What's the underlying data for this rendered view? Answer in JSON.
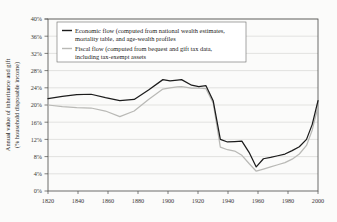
{
  "chart_data": {
    "type": "line",
    "title": "",
    "xlabel": "",
    "ylabel": "Annual value of inheritance and gift (% household disposable income)",
    "ylabel_line1": "Annual value of inheritance and gift",
    "ylabel_line2": "(% household disposable income)",
    "xlim": [
      1820,
      2008
    ],
    "ylim": [
      0,
      40
    ],
    "grid": true,
    "legend_position": "upper-left",
    "xticks": [
      1820,
      1840,
      1860,
      1880,
      1900,
      1920,
      1940,
      1960,
      1980,
      2000
    ],
    "xtick_labels": [
      "1820",
      "1840",
      "1860",
      "1880",
      "1900",
      "1920",
      "1940",
      "1960",
      "1980",
      "2000"
    ],
    "yticks": [
      0,
      4,
      8,
      12,
      16,
      20,
      24,
      28,
      32,
      36,
      40
    ],
    "ytick_labels": [
      "0%",
      "4%",
      "8%",
      "12%",
      "16%",
      "20%",
      "24%",
      "28%",
      "32%",
      "36%",
      "40%"
    ],
    "series": [
      {
        "name": "Economic flow (computed from national wealth estimates, mortality table, and age-wealth profiles",
        "legend_label_line1": "Economic flow (computed from national wealth estimates,",
        "legend_label_line2": "mortality table, and age-wealth profiles",
        "color": "#1c1c1c",
        "x": [
          1820,
          1830,
          1840,
          1850,
          1860,
          1870,
          1880,
          1890,
          1900,
          1905,
          1910,
          1913,
          1920,
          1925,
          1930,
          1935,
          1940,
          1945,
          1950,
          1955,
          1960,
          1965,
          1970,
          1975,
          1980,
          1985,
          1990,
          1995,
          2000,
          2004,
          2008
        ],
        "values": [
          21.5,
          22.0,
          22.4,
          22.5,
          21.7,
          21.0,
          21.3,
          23.5,
          25.9,
          25.6,
          25.8,
          25.9,
          24.6,
          24.3,
          24.5,
          21.0,
          12.0,
          11.4,
          11.5,
          11.6,
          9.0,
          5.6,
          7.5,
          7.8,
          8.2,
          8.6,
          9.4,
          10.3,
          12.0,
          15.5,
          21.0
        ]
      },
      {
        "name": "Fiscal flow (computed from bequest and gift tax data, including tax-exempt assets",
        "legend_label_line1": "Fiscal flow (computed from bequest and gift tax data,",
        "legend_label_line2": "including tax-exempt assets",
        "color": "#b9b9b6",
        "x": [
          1820,
          1830,
          1840,
          1850,
          1860,
          1870,
          1880,
          1890,
          1900,
          1905,
          1910,
          1913,
          1920,
          1925,
          1930,
          1935,
          1940,
          1945,
          1950,
          1955,
          1960,
          1965,
          1970,
          1975,
          1980,
          1985,
          1990,
          1995,
          2000,
          2004,
          2008
        ],
        "values": [
          20.0,
          19.6,
          19.4,
          19.3,
          18.6,
          17.3,
          18.6,
          21.3,
          23.7,
          24.0,
          24.2,
          24.3,
          23.9,
          23.9,
          23.8,
          20.5,
          10.2,
          9.6,
          9.3,
          8.3,
          6.4,
          4.6,
          5.1,
          5.6,
          6.1,
          6.6,
          7.4,
          8.6,
          10.6,
          14.2,
          19.6
        ]
      }
    ]
  }
}
